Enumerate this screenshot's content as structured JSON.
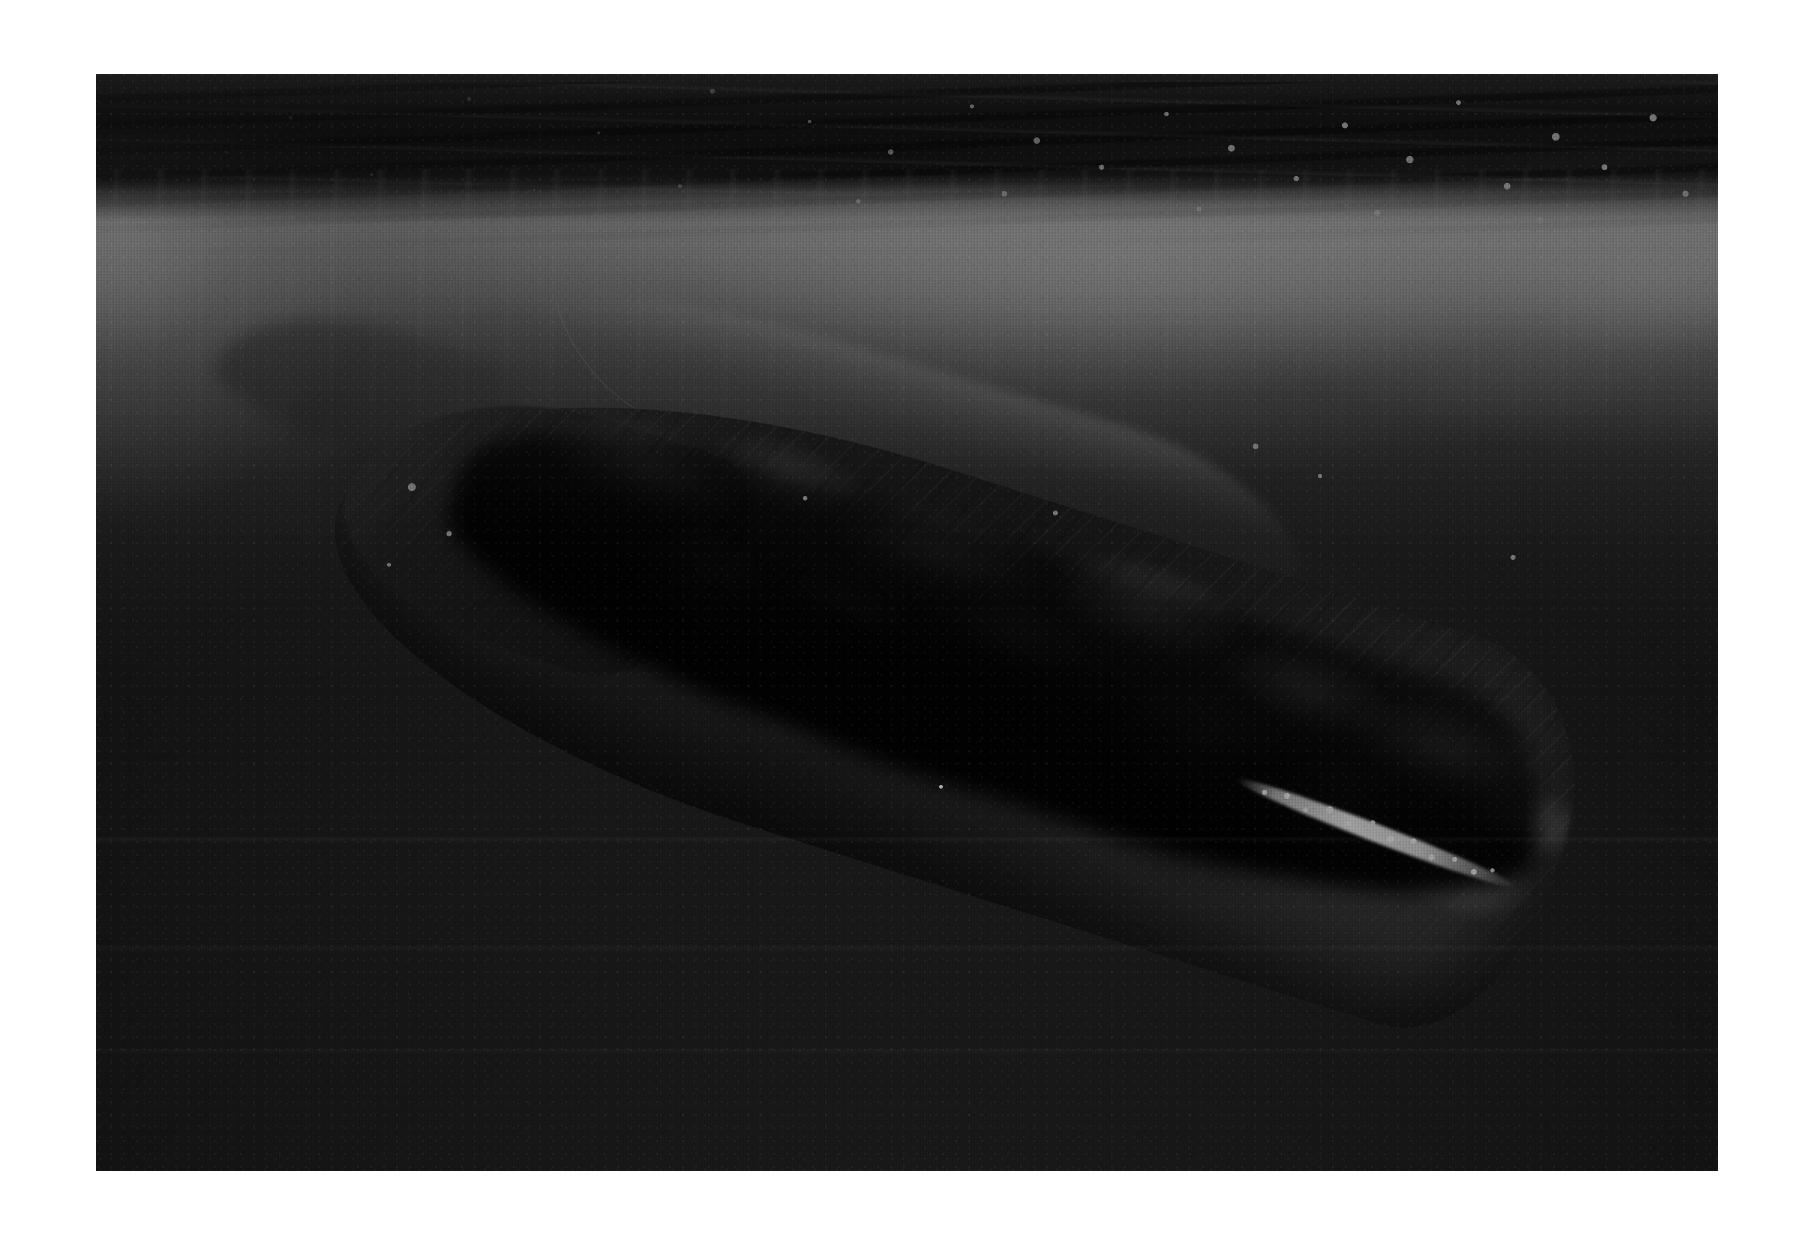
{
  "page": {
    "background_color": "#ffffff",
    "width": 1815,
    "height": 1239
  },
  "photograph": {
    "name": "underwater-sperm-whale-photograph",
    "medium": "black-and-white photographic print",
    "orientation": "landscape",
    "border": {
      "style": "white paper margin",
      "color": "#ffffff",
      "left_px": 96,
      "top_px": 74,
      "right_px": 97,
      "bottom_px": 68
    },
    "frame": {
      "left": 96,
      "top": 74,
      "width": 1622,
      "height": 1097
    },
    "palette": {
      "deep_water": "#1b1b1b",
      "mid_water": "#4a4a4a",
      "surface_glow": "#f2f2f2",
      "surface_dark_waves": "#1a1a1a",
      "whale_body_dark": "#232323",
      "whale_highlight": "#6e6e6e",
      "jaw_white": "#ffffff",
      "paper_white": "#ffffff"
    },
    "subject": {
      "label": "sperm whale swimming just below the water surface",
      "pose": "descending head-down, diagonally from upper-left to lower-right",
      "angle_degrees": 17.5,
      "features": [
        "blunt squared rostrum at upper left",
        "dorsal ridge running along the back",
        "mottled and scarred grey skin",
        "narrow lower jaw with a bright white tooth line",
        "shadowed ventral underside",
        "faint pectoral flipper in the left water column"
      ]
    },
    "scene": {
      "layers": [
        {
          "name": "sky-side-of-surface",
          "description": "dark rippled wave band along the top edge"
        },
        {
          "name": "surface-foam",
          "description": "bright white bubble and foam speckle concentrated on the right half"
        },
        {
          "name": "caustic-band",
          "description": "bright horizontal glow of sunlight just beneath the surface"
        },
        {
          "name": "light-shafts",
          "description": "faint vertical shafts descending from the surface"
        },
        {
          "name": "filament",
          "description": "thin pale line drifting in the upper water"
        },
        {
          "name": "water-column",
          "description": "gradient from bright grey near the surface to near-black at depth"
        },
        {
          "name": "whale",
          "description": "the whale silhouette occupying the centre of the frame"
        },
        {
          "name": "deep-water",
          "description": "uniform near-black water filling the lower third"
        }
      ]
    }
  }
}
